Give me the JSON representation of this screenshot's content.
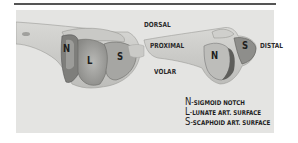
{
  "figure": {
    "orientation_labels": {
      "dorsal": "DORSAL",
      "proximal": "PROXIMAL",
      "volar": "VOLAR",
      "distal": "DISTAL"
    },
    "left_bone_regions": {
      "n": "N",
      "l": "L",
      "s": "S"
    },
    "right_bone_regions": {
      "n": "N",
      "s": "S"
    },
    "legend": [
      {
        "key": "N",
        "dash": "-",
        "text": "SIGMOID NOTCH"
      },
      {
        "key": "L",
        "dash": "-",
        "text": "LUNATE ART. SURFACE"
      },
      {
        "key": "S",
        "dash": "-",
        "text": "SCAPHOID ART. SURFACE"
      }
    ],
    "colors": {
      "panel": "#e4e4e2",
      "bone_light": "#d2d2cf",
      "bone_mid": "#a9a9a6",
      "bone_dark": "#6c6c6a",
      "text": "#1e1e1e"
    }
  }
}
